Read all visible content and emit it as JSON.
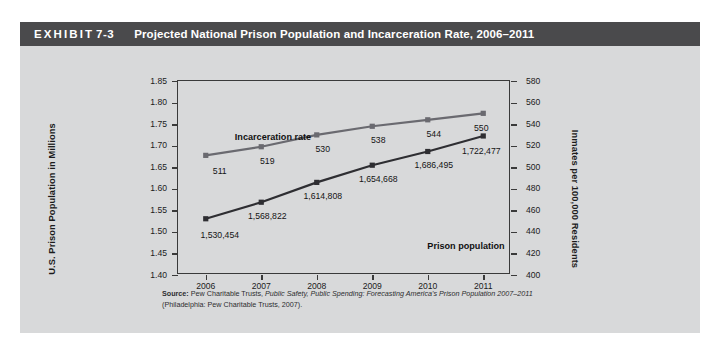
{
  "exhibit": {
    "label": "EXHIBIT",
    "number": "7-3",
    "title": "Projected National Prison Population and Incarceration Rate, 2006–2011"
  },
  "source": {
    "prefix": "Source:",
    "text_1": " Pew Charitable Trusts, ",
    "italic_1": "Public Safety, Public Spending: Forecasting America's Prison Population 2007–2011",
    "text_2": "(Philadelphia: Pew Charitable Trusts, 2007)."
  },
  "colors": {
    "header_band": "#4a4a4c",
    "figure_background": "#d8d9da",
    "rate_series": "#6a6a70",
    "population_series": "#2e2e32",
    "axis": "#3a3a3a"
  },
  "chart_data": {
    "type": "line",
    "title": "Projected National Prison Population and Incarceration Rate, 2006–2011",
    "xlabel": "",
    "categories": [
      "2006",
      "2007",
      "2008",
      "2009",
      "2010",
      "2011"
    ],
    "x": [
      2006,
      2007,
      2008,
      2009,
      2010,
      2011
    ],
    "grid": false,
    "legend": "inline-annotations",
    "axes": {
      "left": {
        "label": "U.S. Prison Population in Millions",
        "min": 1.4,
        "max": 1.85,
        "step": 0.05,
        "ticks": [
          "1.40",
          "1.45",
          "1.50",
          "1.55",
          "1.60",
          "1.65",
          "1.70",
          "1.75",
          "1.80",
          "1.85"
        ]
      },
      "right": {
        "label": "Inmates per 100,000 Residents",
        "min": 400,
        "max": 580,
        "step": 20,
        "ticks": [
          "400",
          "420",
          "440",
          "460",
          "480",
          "500",
          "520",
          "540",
          "560",
          "580"
        ]
      }
    },
    "series": [
      {
        "name": "Incarceration rate",
        "axis": "right",
        "units": "inmates per 100,000 residents",
        "values": [
          511,
          519,
          530,
          538,
          544,
          550
        ],
        "labels": [
          "511",
          "519",
          "530",
          "538",
          "544",
          "550"
        ],
        "color": "#6a6a70"
      },
      {
        "name": "Prison population",
        "axis": "left",
        "units": "inmates",
        "values": [
          1530454,
          1568822,
          1614808,
          1654668,
          1686495,
          1722477
        ],
        "values_millions": [
          1.530454,
          1.568822,
          1.614808,
          1.654668,
          1.686495,
          1.722477
        ],
        "labels": [
          "1,530,454",
          "1,568,822",
          "1,614,808",
          "1,654,668",
          "1,686,495",
          "1,722,477"
        ],
        "color": "#2e2e32"
      }
    ]
  }
}
